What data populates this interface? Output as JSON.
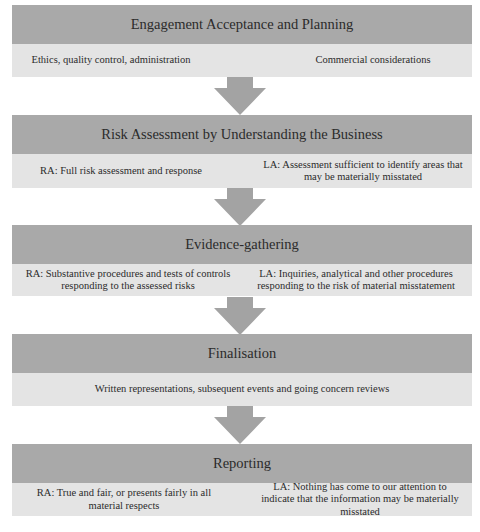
{
  "diagram": {
    "colors": {
      "header_bg": "#a9a9a9",
      "body_bg": "#e4e4e4",
      "arrow": "#a3a3a3"
    },
    "stages": [
      {
        "title": "Engagement Acceptance and Planning",
        "left": "Ethics, quality control, administration",
        "right": "Commercial considerations"
      },
      {
        "title": "Risk Assessment by Understanding the Business",
        "left": "RA: Full risk assessment and response",
        "right": "LA: Assessment sufficient to identify areas that may be materially misstated"
      },
      {
        "title": "Evidence-gathering",
        "left": "RA: Substantive procedures and tests of controls responding to the assessed risks",
        "right": "LA: Inquiries, analytical and other procedures responding to the risk of material misstatement"
      },
      {
        "title": "Finalisation",
        "full": "Written representations, subsequent events and going concern reviews"
      },
      {
        "title": "Reporting",
        "left": "RA: True and fair, or presents fairly in all material respects",
        "right": "LA: Nothing has come to our attention to indicate that the information may be materially misstated"
      }
    ]
  }
}
